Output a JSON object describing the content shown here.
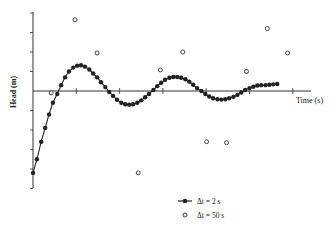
{
  "chart_data": {
    "type": "scatter",
    "title": "",
    "xlabel": "Time (s)",
    "ylabel": "Head (m)",
    "x_ticks_count": 7,
    "y_ticks_above_zero": 4,
    "y_ticks_below_zero": 5,
    "grid": false,
    "legend_position": "bottom-right",
    "units_note": "No numeric tick labels shown; values are in tick-interval units (x: 1 unit = 1 time tick, y: 1 unit = 1 head tick)",
    "series": [
      {
        "name": "Δt = 2 s",
        "marker": "filled-circle-line",
        "x": [
          0.0,
          0.09,
          0.19,
          0.28,
          0.37,
          0.46,
          0.56,
          0.65,
          0.74,
          0.83,
          0.93,
          1.02,
          1.11,
          1.2,
          1.3,
          1.39,
          1.48,
          1.57,
          1.67,
          1.76,
          1.85,
          1.94,
          2.04,
          2.13,
          2.22,
          2.31,
          2.41,
          2.5,
          2.59,
          2.68,
          2.78,
          2.87,
          2.96,
          3.05,
          3.15,
          3.24,
          3.33,
          3.42,
          3.52,
          3.61,
          3.7,
          3.79,
          3.89,
          3.98,
          4.07,
          4.16,
          4.26,
          4.35,
          4.44,
          4.53,
          4.63,
          4.72,
          4.81,
          4.9,
          5.0,
          5.09,
          5.18,
          5.27,
          5.37,
          5.46,
          5.55,
          5.64
        ],
        "y": [
          -4.2,
          -3.5,
          -2.6,
          -1.9,
          -1.2,
          -0.6,
          -0.15,
          0.3,
          0.7,
          1.0,
          1.2,
          1.3,
          1.32,
          1.25,
          1.1,
          0.9,
          0.7,
          0.45,
          0.2,
          -0.05,
          -0.25,
          -0.45,
          -0.6,
          -0.68,
          -0.7,
          -0.68,
          -0.6,
          -0.48,
          -0.32,
          -0.15,
          0.05,
          0.25,
          0.42,
          0.58,
          0.68,
          0.72,
          0.72,
          0.68,
          0.6,
          0.48,
          0.32,
          0.15,
          0.0,
          -0.15,
          -0.28,
          -0.37,
          -0.42,
          -0.44,
          -0.42,
          -0.37,
          -0.3,
          -0.2,
          -0.08,
          0.05,
          0.15,
          0.22,
          0.28,
          0.3,
          0.3,
          0.32,
          0.34,
          0.36
        ]
      },
      {
        "name": "Δt = 50 s",
        "marker": "open-circle",
        "x": [
          0.42,
          0.97,
          1.48,
          2.43,
          2.94,
          3.46,
          4.01,
          4.47,
          4.93,
          5.41,
          5.88
        ],
        "y": [
          -0.1,
          3.65,
          1.95,
          -4.2,
          1.08,
          2.0,
          -2.6,
          -2.65,
          1.0,
          3.2,
          1.95
        ]
      }
    ]
  },
  "legend": {
    "items": [
      {
        "label": "Δt = 2 s",
        "symbol": "filled-circle-line"
      },
      {
        "label": "Δt = 50 s",
        "symbol": "open-circle"
      }
    ]
  },
  "axes": {
    "x_label": "Time (s)",
    "y_label": "Head (m)"
  }
}
